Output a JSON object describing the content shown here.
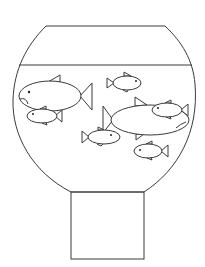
{
  "figure": {
    "stroke_color": "#3a3a3a",
    "background": "#ffffff",
    "bowl": {
      "rim": {
        "x1": 46,
        "x2": 165,
        "y": 26
      },
      "water_line": {
        "x1": 19,
        "x2": 192,
        "y": 65
      },
      "neck_bottom": {
        "x1": 71,
        "x2": 144,
        "y": 192
      }
    },
    "stand": {
      "x": 71,
      "y": 192,
      "width": 73,
      "height": 67
    },
    "fish": [
      {
        "id": "large-fish-left",
        "cx": 50,
        "cy": 96,
        "rx": 31,
        "ry": 15,
        "tail": "right",
        "expression": "frown"
      },
      {
        "id": "small-fish-left",
        "cx": 42,
        "cy": 116,
        "rx": 15,
        "ry": 7,
        "tail": "right"
      },
      {
        "id": "small-fish-top",
        "cx": 127,
        "cy": 83,
        "rx": 14,
        "ry": 7,
        "tail": "left"
      },
      {
        "id": "large-fish-middle",
        "cx": 150,
        "cy": 120,
        "rx": 39,
        "ry": 15,
        "tail": "left"
      },
      {
        "id": "small-fish-right",
        "cx": 167,
        "cy": 110,
        "rx": 15,
        "ry": 7,
        "tail": "right"
      },
      {
        "id": "small-fish-lower-middle",
        "cx": 104,
        "cy": 137,
        "rx": 16,
        "ry": 7,
        "tail": "left"
      },
      {
        "id": "small-fish-bottom-right",
        "cx": 148,
        "cy": 151,
        "rx": 14,
        "ry": 7,
        "tail": "right"
      }
    ],
    "fish_count": 7
  }
}
